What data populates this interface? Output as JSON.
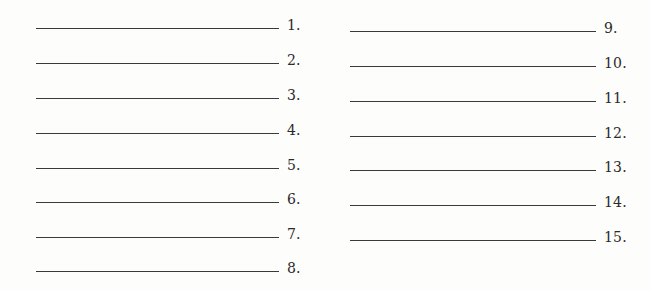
{
  "worksheet": {
    "left_column": {
      "items": [
        {
          "number": "1."
        },
        {
          "number": "2."
        },
        {
          "number": "3."
        },
        {
          "number": "4."
        },
        {
          "number": "5."
        },
        {
          "number": "6."
        },
        {
          "number": "7."
        },
        {
          "number": "8."
        }
      ]
    },
    "right_column": {
      "items": [
        {
          "number": "9."
        },
        {
          "number": "10."
        },
        {
          "number": "11."
        },
        {
          "number": "12."
        },
        {
          "number": "13."
        },
        {
          "number": "14."
        },
        {
          "number": "15."
        }
      ]
    }
  }
}
